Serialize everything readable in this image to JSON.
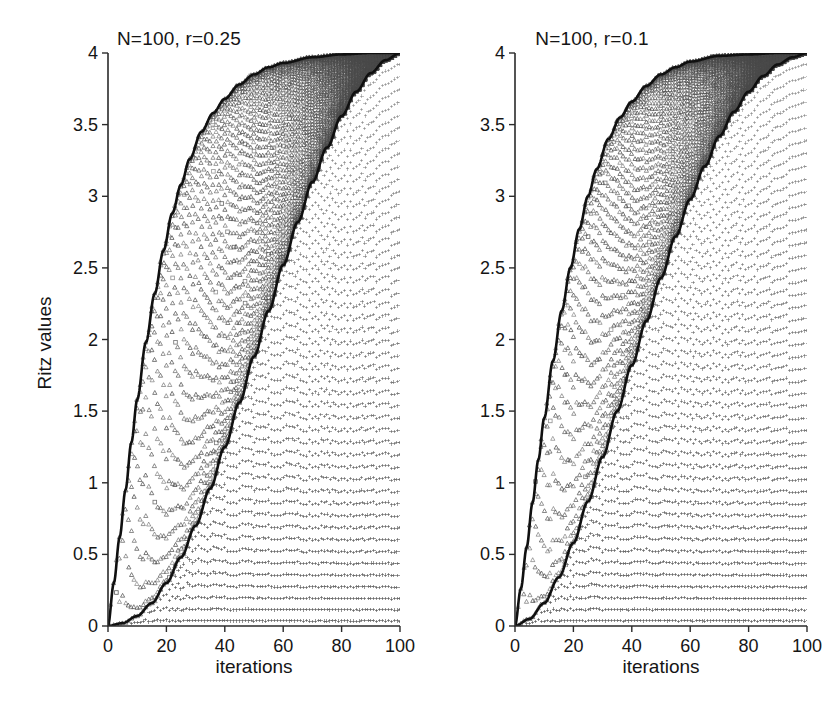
{
  "figure": {
    "width": 837,
    "height": 701,
    "background": "#ffffff",
    "marker_color": "#4a4a4a",
    "boundary_color": "#101010",
    "axis_color": "#2b2b2b"
  },
  "chart_data": [
    {
      "type": "scatter",
      "title": "N=100, r=0.25",
      "xlabel": "iterations",
      "ylabel": "Ritz values",
      "xlim": [
        0,
        100
      ],
      "ylim": [
        0,
        4
      ],
      "xticks": [
        0,
        20,
        40,
        60,
        80,
        100
      ],
      "xticklabels": [
        "0",
        "20",
        "40",
        "60",
        "80",
        "100"
      ],
      "yticks": [
        0,
        0.5,
        1,
        1.5,
        2,
        2.5,
        3,
        3.5,
        4
      ],
      "yticklabels": [
        "0",
        "0.5",
        "1",
        "1.5",
        "2",
        "2.5",
        "3",
        "3.5",
        "4"
      ],
      "grid": false,
      "legend": null,
      "series": [
        {
          "name": "Ritz values (triangle markers, inside band)",
          "marker": "triangle",
          "description": "At iteration k the k Ritz values of the Lanczos tridiagonal matrix are plotted as a vertical column of triangles spanning from the lower boundary curve to the upper boundary curve; columns k = 1..100."
        },
        {
          "name": "Converged / outlier Ritz values (plus markers, right of lower boundary)",
          "marker": "plus",
          "description": "Plus markers form horizontal rows to the right of the lower boundary curve, indicating Ritz values that have settled onto fixed levels."
        }
      ],
      "boundary_curves": [
        {
          "name": "upper-boundary",
          "style": "thick solid black",
          "points": [
            [
              0,
              0.0
            ],
            [
              2,
              0.3
            ],
            [
              4,
              0.62
            ],
            [
              6,
              0.95
            ],
            [
              8,
              1.28
            ],
            [
              10,
              1.58
            ],
            [
              13,
              1.98
            ],
            [
              16,
              2.32
            ],
            [
              19,
              2.62
            ],
            [
              22,
              2.88
            ],
            [
              25,
              3.08
            ],
            [
              28,
              3.26
            ],
            [
              32,
              3.45
            ],
            [
              36,
              3.58
            ],
            [
              40,
              3.68
            ],
            [
              45,
              3.78
            ],
            [
              50,
              3.85
            ],
            [
              55,
              3.9
            ],
            [
              60,
              3.93
            ],
            [
              70,
              3.97
            ],
            [
              80,
              3.99
            ],
            [
              90,
              4.0
            ],
            [
              100,
              4.0
            ]
          ]
        },
        {
          "name": "lower-boundary",
          "style": "thick solid black",
          "points": [
            [
              0,
              0.0
            ],
            [
              5,
              0.02
            ],
            [
              10,
              0.07
            ],
            [
              15,
              0.16
            ],
            [
              20,
              0.3
            ],
            [
              25,
              0.48
            ],
            [
              30,
              0.7
            ],
            [
              35,
              0.96
            ],
            [
              40,
              1.25
            ],
            [
              45,
              1.56
            ],
            [
              50,
              1.88
            ],
            [
              55,
              2.2
            ],
            [
              60,
              2.52
            ],
            [
              65,
              2.82
            ],
            [
              70,
              3.1
            ],
            [
              75,
              3.34
            ],
            [
              80,
              3.56
            ],
            [
              85,
              3.73
            ],
            [
              90,
              3.86
            ],
            [
              95,
              3.95
            ],
            [
              100,
              4.0
            ]
          ]
        }
      ]
    },
    {
      "type": "scatter",
      "title": "N=100, r=0.1",
      "xlabel": "iterations",
      "ylabel": "Ritz values",
      "xlim": [
        0,
        100
      ],
      "ylim": [
        0,
        4
      ],
      "xticks": [
        0,
        20,
        40,
        60,
        80,
        100
      ],
      "xticklabels": [
        "0",
        "20",
        "40",
        "60",
        "80",
        "100"
      ],
      "yticks": [
        0,
        0.5,
        1,
        1.5,
        2,
        2.5,
        3,
        3.5,
        4
      ],
      "yticklabels": [
        "0",
        "0.5",
        "1",
        "1.5",
        "2",
        "2.5",
        "3",
        "3.5",
        "4"
      ],
      "grid": false,
      "legend": null,
      "series": [
        {
          "name": "Ritz values (triangle markers, inside band)",
          "marker": "triangle",
          "description": "Narrower band than the r=0.25 panel; triangle columns span between the two boundary curves for iterations k = 1..100."
        },
        {
          "name": "Converged / outlier Ritz values (plus markers, right of lower boundary)",
          "marker": "plus",
          "description": "Plus markers form horizontal rows to the right of the lower boundary curve."
        }
      ],
      "boundary_curves": [
        {
          "name": "upper-boundary",
          "style": "thick solid black",
          "points": [
            [
              0,
              0.0
            ],
            [
              2,
              0.26
            ],
            [
              4,
              0.55
            ],
            [
              6,
              0.86
            ],
            [
              8,
              1.16
            ],
            [
              10,
              1.45
            ],
            [
              13,
              1.85
            ],
            [
              16,
              2.2
            ],
            [
              19,
              2.5
            ],
            [
              22,
              2.77
            ],
            [
              25,
              3.0
            ],
            [
              28,
              3.19
            ],
            [
              32,
              3.4
            ],
            [
              36,
              3.55
            ],
            [
              40,
              3.66
            ],
            [
              45,
              3.77
            ],
            [
              50,
              3.85
            ],
            [
              55,
              3.9
            ],
            [
              60,
              3.94
            ],
            [
              70,
              3.98
            ],
            [
              80,
              3.99
            ],
            [
              90,
              4.0
            ],
            [
              100,
              4.0
            ]
          ]
        },
        {
          "name": "lower-boundary",
          "style": "thick solid black",
          "points": [
            [
              0,
              0.0
            ],
            [
              5,
              0.05
            ],
            [
              10,
              0.16
            ],
            [
              15,
              0.34
            ],
            [
              20,
              0.58
            ],
            [
              25,
              0.87
            ],
            [
              30,
              1.18
            ],
            [
              35,
              1.5
            ],
            [
              40,
              1.82
            ],
            [
              45,
              2.13
            ],
            [
              50,
              2.43
            ],
            [
              55,
              2.72
            ],
            [
              60,
              2.98
            ],
            [
              65,
              3.21
            ],
            [
              70,
              3.42
            ],
            [
              75,
              3.59
            ],
            [
              80,
              3.73
            ],
            [
              85,
              3.84
            ],
            [
              90,
              3.92
            ],
            [
              95,
              3.97
            ],
            [
              100,
              4.0
            ]
          ]
        }
      ]
    }
  ],
  "panels": [
    {
      "id": "left",
      "title": "N=100, r=0.25",
      "xlabel": "iterations",
      "ylabel": "Ritz values",
      "xticklabels": [
        "0",
        "20",
        "40",
        "60",
        "80",
        "100"
      ],
      "yticklabels": [
        "0",
        "0.5",
        "1",
        "1.5",
        "2",
        "2.5",
        "3",
        "3.5",
        "4"
      ]
    },
    {
      "id": "right",
      "title": "N=100, r=0.1",
      "xlabel": "iterations",
      "ylabel": "Ritz values",
      "xticklabels": [
        "0",
        "20",
        "40",
        "60",
        "80",
        "100"
      ],
      "yticklabels": [
        "0",
        "0.5",
        "1",
        "1.5",
        "2",
        "2.5",
        "3",
        "3.5",
        "4"
      ]
    }
  ]
}
